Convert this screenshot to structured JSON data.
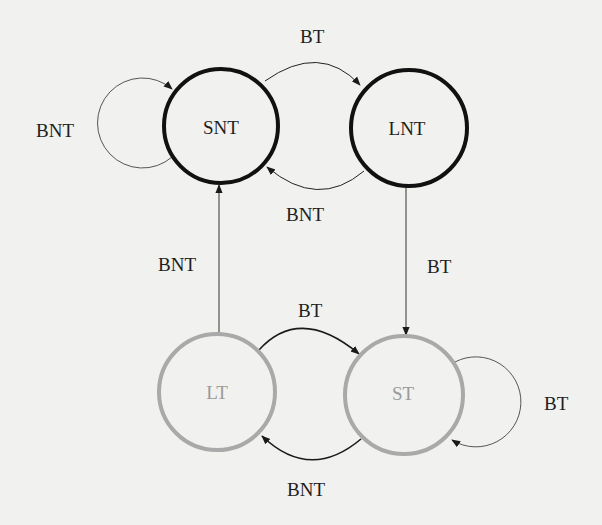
{
  "diagram": {
    "type": "state-machine",
    "colors": {
      "background": "#f1f1ef",
      "not_taken_state_stroke": "#111111",
      "taken_state_stroke": "#a9a9a9",
      "taken_state_text": "#9a9a9a",
      "edge": "#222222",
      "label_text": "#1e1e1e"
    },
    "nodes": [
      {
        "id": "SNT",
        "label": "SNT"
      },
      {
        "id": "LNT",
        "label": "LNT"
      },
      {
        "id": "LT",
        "label": "LT"
      },
      {
        "id": "ST",
        "label": "ST"
      }
    ],
    "edges": [
      {
        "from": "SNT",
        "to": "SNT",
        "label": "BNT"
      },
      {
        "from": "SNT",
        "to": "LNT",
        "label": "BT"
      },
      {
        "from": "LNT",
        "to": "SNT",
        "label": "BNT"
      },
      {
        "from": "LNT",
        "to": "ST",
        "label": "BT"
      },
      {
        "from": "LT",
        "to": "SNT",
        "label": "BNT"
      },
      {
        "from": "LT",
        "to": "ST",
        "label": "BT"
      },
      {
        "from": "ST",
        "to": "LT",
        "label": "BNT"
      },
      {
        "from": "ST",
        "to": "ST",
        "label": "BT"
      }
    ]
  }
}
